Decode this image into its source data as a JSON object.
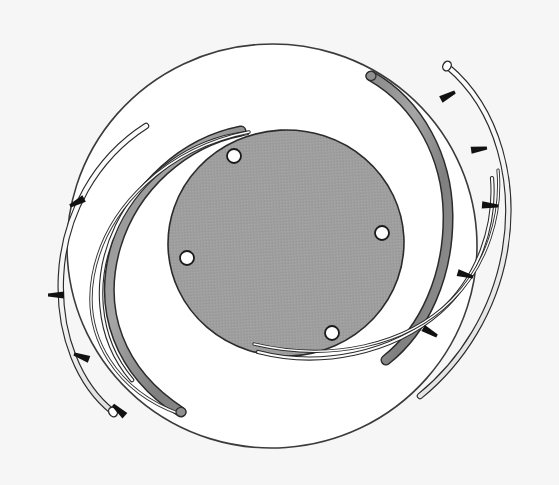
{
  "figure": {
    "kind": "technical-line-diagram",
    "canvas": {
      "width": 559,
      "height": 485
    },
    "background_color": "#f4f4f4",
    "ink_color": "#1a1a1a"
  },
  "colors": {
    "page_background": "#f4f4f4",
    "outer_disc_fill": "#ffffff",
    "outer_disc_stroke": "#3b3b3b",
    "inner_disc_fill": "#9e9e9e",
    "inner_disc_stroke": "#2b2b2b",
    "band_fill": "#8f8f8f",
    "band_stroke": "#2b2b2b",
    "wire_fill": "#ffffff",
    "wire_stroke": "#2a2a2a",
    "hole_fill": "#ffffff",
    "hole_stroke": "#1a1a1a",
    "arrow_color": "#111111"
  },
  "shapes": {
    "outer_disc": {
      "label": "large white disc",
      "cx": 272,
      "cy": 246,
      "rx": 205,
      "ry": 202,
      "rotation": -4
    },
    "inner_disc": {
      "label": "shaded central disc",
      "cx": 286,
      "cy": 243,
      "rx": 118,
      "ry": 113,
      "rotation": -3
    },
    "band": {
      "label": "thick gray wrap band",
      "cx": 272,
      "cy": 243,
      "rx": 172,
      "ry": 168,
      "rotation": -6,
      "thickness": 8,
      "start_angle_deg": -78,
      "end_angle_deg": 128
    },
    "outer_wire": {
      "label": "outer guide wire",
      "cx": 272,
      "cy": 243,
      "rx": 202,
      "ry": 196,
      "rotation": -6,
      "thickness": 5,
      "start_angle_deg": -68,
      "end_angle_deg": 120
    },
    "inner_wire": {
      "label": "inner crossing wire",
      "thickness": 4
    }
  },
  "holes": {
    "label": "mounting holes",
    "count": 4,
    "radius": 7,
    "items": [
      {
        "name": "hole-top",
        "cx": 234,
        "cy": 156
      },
      {
        "name": "hole-right",
        "cx": 382,
        "cy": 233
      },
      {
        "name": "hole-left",
        "cx": 187,
        "cy": 258
      },
      {
        "name": "hole-bottom",
        "cx": 332,
        "cy": 333
      }
    ]
  },
  "arrows": {
    "label": "direction of force markers",
    "count": 8,
    "items": [
      {
        "name": "arrow-top-right",
        "x": 455,
        "y": 92,
        "angle": 152
      },
      {
        "name": "arrow-right-upper",
        "x": 487,
        "y": 148,
        "angle": 172
      },
      {
        "name": "arrow-right-mid",
        "x": 498,
        "y": 206,
        "angle": 184
      },
      {
        "name": "arrow-right-lower",
        "x": 473,
        "y": 277,
        "angle": 196
      },
      {
        "name": "arrow-bottom-right",
        "x": 437,
        "y": 336,
        "angle": 210
      },
      {
        "name": "arrow-left-upper",
        "x": 70,
        "y": 206,
        "angle": 332
      },
      {
        "name": "arrow-left-mid",
        "x": 48,
        "y": 295,
        "angle": 0
      },
      {
        "name": "arrow-left-lower",
        "x": 74,
        "y": 354,
        "angle": 20
      },
      {
        "name": "arrow-bottom-left",
        "x": 113,
        "y": 405,
        "angle": 42
      }
    ]
  }
}
